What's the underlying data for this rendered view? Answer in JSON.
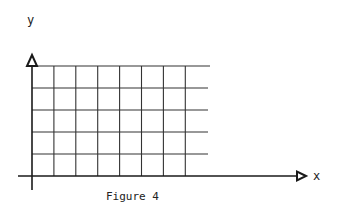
{
  "figure": {
    "caption": "Figure 4",
    "x_axis_label": "x",
    "y_axis_label": "y",
    "grid": {
      "columns": 8,
      "rows": 5,
      "origin_px": [
        32,
        176
      ],
      "cell_width_px": 21.9,
      "cell_height_px": 22
    },
    "colors": {
      "line": "#333333",
      "axis": "#1a1a1a",
      "background": "#ffffff"
    }
  }
}
